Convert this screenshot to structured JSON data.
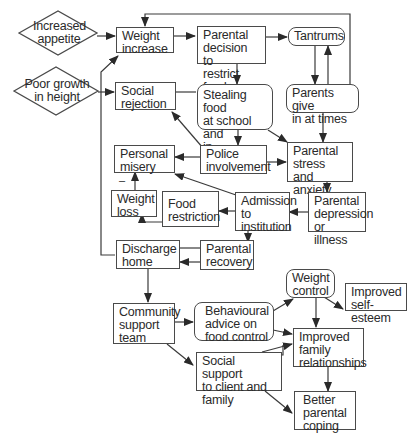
{
  "diagram": {
    "nodes": {
      "increased_appetite": "Increased\nappetite",
      "poor_growth": "Poor growth\nin height",
      "weight_increase": "Weight\nincrease",
      "parental_decision": "Parental\ndecision to\nrestrict food",
      "tantrums": "Tantrums",
      "parents_give_in": "Parents give\nin at times",
      "social_rejection": "Social\nrejection",
      "stealing_food": "Stealing  food\nat  school and\nin community",
      "personal_misery": "Personal\nmisery",
      "police_involvement": "Police\ninvolvement",
      "parental_stress": "Parental\nstress and\nanxiety",
      "weight_loss": "Weight\nloss",
      "food_restriction": "Food\nrestriction",
      "admission": "Admission\nto\ninstitution",
      "parental_depression": "Parental\ndepression\nor illness",
      "discharge_home": "Discharge\nhome",
      "parental_recovery": "Parental\nrecovery",
      "community_support": "Community\nsupport\nteam",
      "behavioural_advice": "Behavioural\nadvice on\nfood control",
      "weight_control": "Weight\ncontrol",
      "improved_self_esteem": "Improved\nself-esteem",
      "improved_family": "Improved\nfamily\nrelationships",
      "social_support": "Social support\nto client and\nfamily",
      "better_coping": "Better\nparental\ncoping"
    },
    "annotations": {
      "minus_sign": "–"
    },
    "edges": [
      [
        "increased_appetite",
        "weight_increase"
      ],
      [
        "poor_growth",
        "social_rejection"
      ],
      [
        "discharge_home",
        "weight_increase"
      ],
      [
        "weight_increase",
        "parental_decision"
      ],
      [
        "parental_decision",
        "tantrums"
      ],
      [
        "parental_decision",
        "stealing_food"
      ],
      [
        "tantrums",
        "parents_give_in"
      ],
      [
        "parents_give_in",
        "tantrums"
      ],
      [
        "parents_give_in",
        "weight_increase"
      ],
      [
        "parents_give_in",
        "parental_stress"
      ],
      [
        "social_rejection",
        "stealing_food"
      ],
      [
        "stealing_food",
        "police_involvement"
      ],
      [
        "stealing_food",
        "parental_stress"
      ],
      [
        "police_involvement",
        "social_rejection"
      ],
      [
        "police_involvement",
        "personal_misery"
      ],
      [
        "police_involvement",
        "parental_stress"
      ],
      [
        "parental_stress",
        "parental_depression"
      ],
      [
        "parental_depression",
        "admission"
      ],
      [
        "admission",
        "food_restriction"
      ],
      [
        "admission",
        "personal_misery"
      ],
      [
        "admission",
        "parental_recovery"
      ],
      [
        "food_restriction",
        "weight_loss"
      ],
      [
        "weight_loss",
        "personal_misery"
      ],
      [
        "parental_recovery",
        "discharge_home"
      ],
      [
        "discharge_home",
        "community_support"
      ],
      [
        "community_support",
        "behavioural_advice"
      ],
      [
        "community_support",
        "social_support"
      ],
      [
        "behavioural_advice",
        "weight_control"
      ],
      [
        "behavioural_advice",
        "improved_family"
      ],
      [
        "weight_control",
        "improved_self_esteem"
      ],
      [
        "weight_control",
        "improved_family"
      ],
      [
        "social_support",
        "improved_family"
      ],
      [
        "social_support",
        "better_coping"
      ],
      [
        "improved_family",
        "better_coping"
      ]
    ]
  }
}
